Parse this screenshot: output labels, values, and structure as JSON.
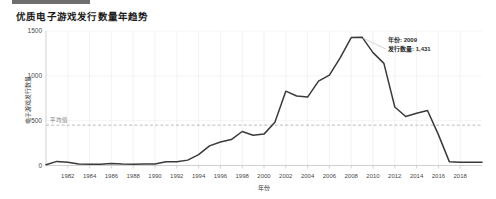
{
  "header": {
    "title": "优质电子游戏发行数量年趋势"
  },
  "chart_data": {
    "type": "line",
    "title": "优质电子游戏发行数量年趋势",
    "xlabel": "年份",
    "ylabel": "电子游戏发行数量",
    "xlim": [
      1980,
      2020
    ],
    "ylim": [
      0,
      1500
    ],
    "grid": true,
    "legend_position": "none",
    "x": [
      1980,
      1981,
      1982,
      1983,
      1984,
      1985,
      1986,
      1987,
      1988,
      1989,
      1990,
      1991,
      1992,
      1993,
      1994,
      1995,
      1996,
      1997,
      1998,
      1999,
      2000,
      2001,
      2002,
      2003,
      2004,
      2005,
      2006,
      2007,
      2008,
      2009,
      2010,
      2011,
      2012,
      2013,
      2014,
      2015,
      2016,
      2017,
      2018,
      2019,
      2020
    ],
    "values": [
      9,
      46,
      36,
      17,
      14,
      14,
      21,
      16,
      15,
      17,
      16,
      41,
      43,
      60,
      121,
      219,
      263,
      289,
      379,
      338,
      350,
      482,
      829,
      775,
      763,
      941,
      1008,
      1202,
      1427,
      1431,
      1259,
      1139,
      653,
      546,
      582,
      614,
      344,
      43,
      36,
      36,
      36
    ],
    "x_tick_labels": [
      "1982",
      "1984",
      "1986",
      "1988",
      "1990",
      "1992",
      "1994",
      "1996",
      "1998",
      "2000",
      "2002",
      "2004",
      "2006",
      "2008",
      "2010",
      "2012",
      "2014",
      "2016",
      "2018"
    ],
    "x_ticks": [
      1982,
      1984,
      1986,
      1988,
      1990,
      1992,
      1994,
      1996,
      1998,
      2000,
      2002,
      2004,
      2006,
      2008,
      2010,
      2012,
      2014,
      2016,
      2018
    ],
    "y_tick_labels": [
      "0",
      "500",
      "1000",
      "1500"
    ],
    "y_ticks": [
      0,
      500,
      1000,
      1500
    ],
    "series_color": "#3a3a3a",
    "mean_line": {
      "label": "平均值",
      "value": 450,
      "color": "#a9a9a9"
    },
    "annotations": [
      {
        "name": "peak-annotation",
        "year_label": "年份: 2009",
        "count_label": "发行数量: 1,431",
        "x": 2009,
        "y": 1431
      }
    ]
  }
}
